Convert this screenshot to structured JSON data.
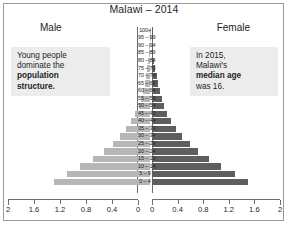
{
  "chart_data": {
    "type": "bar",
    "chart_subtype": "population-pyramid",
    "title": "Malawi – 2014",
    "xlabel": "",
    "ylabel": "",
    "units": "millions of people",
    "grid": false,
    "legend_position": "none",
    "side_labels": {
      "left": "Male",
      "right": "Female"
    },
    "axis": {
      "left_ticks": [
        "2",
        "1.6",
        "1.2",
        "0.8",
        "0.4",
        "0"
      ],
      "right_ticks": [
        "0",
        "0.4",
        "0.8",
        "1.2",
        "1.6",
        "2"
      ],
      "xlim_left": [
        2,
        0
      ],
      "xlim_right": [
        0,
        2
      ],
      "tick_step": 0.4
    },
    "categories": [
      "100+",
      "95 – 99",
      "90 – 94",
      "85 – 89",
      "80 – 84",
      "75 – 79",
      "70 – 74",
      "65 – 69",
      "60 – 64",
      "55 – 59",
      "50 – 54",
      "45 – 49",
      "40 – 44",
      "35 – 39",
      "30 – 34",
      "25 – 29",
      "20 – 24",
      "15 – 19",
      "10 – 14",
      "5 – 9",
      "0 – 4"
    ],
    "series": [
      {
        "name": "Male",
        "side": "left",
        "color": "#b6b6b6",
        "values": [
          0.002,
          0.004,
          0.008,
          0.016,
          0.028,
          0.044,
          0.062,
          0.083,
          0.108,
          0.139,
          0.176,
          0.224,
          0.287,
          0.368,
          0.462,
          0.576,
          0.712,
          0.878,
          1.071,
          1.28,
          1.48
        ]
      },
      {
        "name": "Female",
        "side": "right",
        "color": "#5e5e5e",
        "values": [
          0.003,
          0.006,
          0.011,
          0.02,
          0.034,
          0.051,
          0.071,
          0.093,
          0.119,
          0.151,
          0.19,
          0.238,
          0.3,
          0.381,
          0.476,
          0.59,
          0.726,
          0.892,
          1.085,
          1.3,
          1.5
        ]
      }
    ],
    "annotations": [
      {
        "id": "note-left",
        "lines": [
          "Young people",
          "dominate the",
          "population",
          "structure."
        ],
        "bold_lines": [
          "population",
          "structure."
        ],
        "position": "upper-left"
      },
      {
        "id": "note-right",
        "lines": [
          "In 2015,",
          "Malawi's",
          "median age",
          "was 16."
        ],
        "bold_lines": [
          "median age"
        ],
        "position": "upper-right"
      }
    ]
  },
  "colors": {
    "male_bar": "#b6b6b6",
    "female_bar": "#5e5e5e",
    "note_bg": "#ececed",
    "frame": "#9a9a9a",
    "axis": "#6e6e6e",
    "text": "#1e1e1e"
  },
  "note_left": {
    "line1": "Young people",
    "line2": "dominate the",
    "line3": "population",
    "line4": "structure."
  },
  "note_right": {
    "line1": "In 2015,",
    "line2": "Malawi's",
    "line3": "median age",
    "line4": "was 16."
  }
}
